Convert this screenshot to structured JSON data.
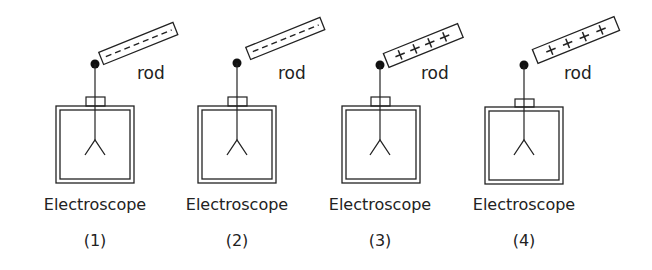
{
  "diagram": {
    "title": "",
    "stroke_color": "#222222",
    "background": "#ffffff",
    "panels": [
      {
        "index": "(1)",
        "device_label": "Electroscope",
        "rod_label": "rod",
        "rod_charge": "negative",
        "rod_symbols": "- - - - - -",
        "rod_touching": true
      },
      {
        "index": "(2)",
        "device_label": "Electroscope",
        "rod_label": "rod",
        "rod_charge": "negative",
        "rod_symbols": "- - - - - -",
        "rod_touching": false
      },
      {
        "index": "(3)",
        "device_label": "Electroscope",
        "rod_label": "rod",
        "rod_charge": "positive",
        "rod_symbols": "+ + + + +",
        "rod_touching": true
      },
      {
        "index": "(4)",
        "device_label": "Electroscope",
        "rod_label": "rod",
        "rod_charge": "positive",
        "rod_symbols": "+ + + +",
        "rod_touching": false
      }
    ]
  }
}
